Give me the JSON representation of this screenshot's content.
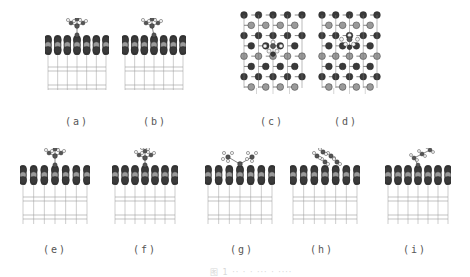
{
  "figure": {
    "panels": [
      {
        "id": "a",
        "label": "(a)",
        "view": "side",
        "adsorbate": "tbu-center",
        "x": 45,
        "y": 18,
        "w": 64,
        "h": 72,
        "label_x": 77,
        "label_y": 116
      },
      {
        "id": "b",
        "label": "(b)",
        "view": "side",
        "adsorbate": "tbu-tilt",
        "x": 122,
        "y": 18,
        "w": 64,
        "h": 72,
        "label_x": 155,
        "label_y": 116
      },
      {
        "id": "c",
        "label": "(c)",
        "view": "top",
        "adsorbate": "center",
        "x": 240,
        "y": 10,
        "w": 66,
        "h": 86,
        "label_x": 272,
        "label_y": 116
      },
      {
        "id": "d",
        "label": "(d)",
        "view": "top",
        "adsorbate": "upper",
        "x": 318,
        "y": 10,
        "w": 63,
        "h": 86,
        "label_x": 346,
        "label_y": 116
      },
      {
        "id": "e",
        "label": "(e)",
        "view": "side",
        "adsorbate": "tbu-center",
        "x": 20,
        "y": 148,
        "w": 70,
        "h": 76,
        "label_x": 55,
        "label_y": 244
      },
      {
        "id": "f",
        "label": "(f)",
        "view": "side",
        "adsorbate": "small",
        "x": 112,
        "y": 148,
        "w": 66,
        "h": 76,
        "label_x": 145,
        "label_y": 244
      },
      {
        "id": "g",
        "label": "(g)",
        "view": "side",
        "adsorbate": "bridge-pair",
        "x": 205,
        "y": 148,
        "w": 70,
        "h": 76,
        "label_x": 242,
        "label_y": 244
      },
      {
        "id": "h",
        "label": "(h)",
        "view": "side",
        "adsorbate": "cluster",
        "x": 290,
        "y": 148,
        "w": 70,
        "h": 76,
        "label_x": 322,
        "label_y": 244
      },
      {
        "id": "i",
        "label": "(i)",
        "view": "side",
        "adsorbate": "chain",
        "x": 385,
        "y": 148,
        "w": 66,
        "h": 76,
        "label_x": 415,
        "label_y": 244
      }
    ],
    "caption": "图 1 ·· · · ··· · ····"
  },
  "colors": {
    "dark_atom": "#3a3a3a",
    "light_atom": "#9a9a9a",
    "hydrogen": "#f4f4f4",
    "carbon": "#555555",
    "lattice": "#9a9a9a",
    "label": "#555555"
  }
}
